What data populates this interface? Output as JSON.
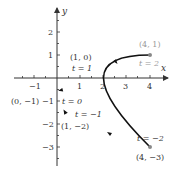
{
  "diagram": {
    "type": "parametric-curve",
    "axes": {
      "x_label": "x",
      "y_label": "y",
      "x_ticks": [
        -1,
        1,
        2,
        3,
        4
      ],
      "y_ticks": [
        2,
        1,
        -1,
        -2,
        -3
      ],
      "x_tick_labels": [
        "−1",
        "1",
        "2",
        "3",
        "4"
      ],
      "y_tick_labels": [
        "2",
        "1",
        "−1",
        "−2",
        "−3"
      ]
    },
    "points": [
      {
        "label": "(1, 0)",
        "t_label": "t = 1",
        "x": 1,
        "y": 0
      },
      {
        "label": "(4, 1)",
        "t_label": "t = 2",
        "x": 4,
        "y": 1
      },
      {
        "label": "(0, −1)",
        "t_label": "t = 0",
        "x": 0,
        "y": -1
      },
      {
        "label": "(1, −2)",
        "t_label": "t = −1",
        "x": 1,
        "y": -2
      },
      {
        "label": "(4, −3)",
        "t_label": "t = −2",
        "x": 4,
        "y": -3
      }
    ],
    "colors": {
      "curve": "#111111",
      "axis": "#333333",
      "endpoint": "#888888",
      "faded_label": "#999999"
    }
  }
}
